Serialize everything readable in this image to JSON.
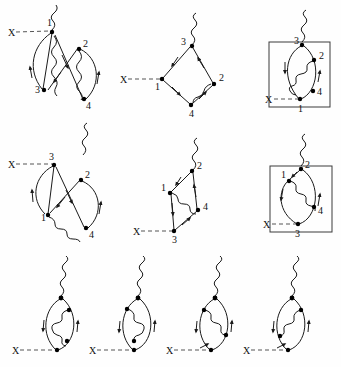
{
  "figure": {
    "background_color": "#fefefe",
    "line_color": "#1a1a1a",
    "vertex_color": "#000000",
    "dashed_color": "#555555",
    "external_label": "X",
    "rows": [
      {
        "row_index": 0,
        "diagram_count": 3,
        "diagrams": [
          {
            "id": "d1",
            "style": "crossed-open",
            "boxed": false,
            "vertex_labels": [
              "1",
              "2",
              "3",
              "4"
            ],
            "external_label": "X",
            "photon_label": "",
            "vertices": 4
          },
          {
            "id": "d2",
            "style": "diamond",
            "boxed": false,
            "vertex_labels": [
              "1",
              "2",
              "3",
              "4"
            ],
            "external_label": "X",
            "photon_label": "",
            "vertices": 4
          },
          {
            "id": "d3",
            "style": "loop-boxed",
            "boxed": true,
            "vertex_labels": [
              "1",
              "2",
              "3",
              "4"
            ],
            "external_label": "X",
            "photon_label": "",
            "vertices": 4
          }
        ]
      },
      {
        "row_index": 1,
        "diagram_count": 3,
        "diagrams": [
          {
            "id": "d4",
            "style": "crossed-open",
            "boxed": false,
            "vertex_labels": [
              "1",
              "2",
              "3",
              "4"
            ],
            "external_label": "X",
            "photon_label": "",
            "vertices": 4
          },
          {
            "id": "d5",
            "style": "diamond",
            "boxed": false,
            "vertex_labels": [
              "1",
              "2",
              "3",
              "4"
            ],
            "external_label": "X",
            "photon_label": "",
            "vertices": 4
          },
          {
            "id": "d6",
            "style": "loop-boxed",
            "boxed": true,
            "vertex_labels": [
              "1",
              "2",
              "3",
              "4"
            ],
            "external_label": "X",
            "photon_label": "",
            "vertices": 4
          }
        ]
      },
      {
        "row_index": 2,
        "diagram_count": 4,
        "diagrams": [
          {
            "id": "d7",
            "style": "loop-self-energy",
            "boxed": false,
            "vertex_labels": [],
            "external_label": "X",
            "photon_label": "",
            "vertices": 4
          },
          {
            "id": "d8",
            "style": "loop-self-energy",
            "boxed": false,
            "vertex_labels": [],
            "external_label": "X",
            "photon_label": "",
            "vertices": 4
          },
          {
            "id": "d9",
            "style": "loop-self-energy",
            "boxed": false,
            "vertex_labels": [],
            "external_label": "X",
            "photon_label": "",
            "vertices": 4
          },
          {
            "id": "d10",
            "style": "loop-self-energy",
            "boxed": false,
            "vertex_labels": [],
            "external_label": "X",
            "photon_label": "",
            "vertices": 4
          }
        ]
      }
    ]
  }
}
